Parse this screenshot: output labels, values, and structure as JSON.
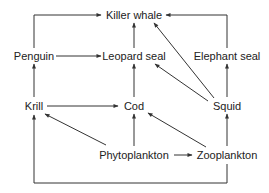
{
  "diagram": {
    "type": "food-web",
    "colors": {
      "background": "#ffffff",
      "line": "#333333",
      "text": "#222222"
    },
    "nodes": {
      "killer_whale": "Killer whale",
      "penguin": "Penguin",
      "leopard_seal": "Leopard seal",
      "elephant_seal": "Elephant seal",
      "krill": "Krill",
      "cod": "Cod",
      "squid": "Squid",
      "phytoplankton": "Phytoplankton",
      "zooplankton": "Zooplankton"
    },
    "edges": [
      {
        "from": "Penguin",
        "to": "Killer whale"
      },
      {
        "from": "Leopard seal",
        "to": "Killer whale"
      },
      {
        "from": "Elephant seal",
        "to": "Killer whale"
      },
      {
        "from": "Squid",
        "to": "Killer whale"
      },
      {
        "from": "Penguin",
        "to": "Leopard seal"
      },
      {
        "from": "Cod",
        "to": "Leopard seal"
      },
      {
        "from": "Squid",
        "to": "Leopard seal"
      },
      {
        "from": "Squid",
        "to": "Elephant seal"
      },
      {
        "from": "Krill",
        "to": "Penguin"
      },
      {
        "from": "Krill",
        "to": "Cod"
      },
      {
        "from": "Phytoplankton",
        "to": "Krill"
      },
      {
        "from": "Phytoplankton",
        "to": "Cod"
      },
      {
        "from": "Phytoplankton",
        "to": "Zooplankton"
      },
      {
        "from": "Zooplankton",
        "to": "Cod"
      },
      {
        "from": "Zooplankton",
        "to": "Squid"
      },
      {
        "from": "Zooplankton",
        "to": "Krill"
      }
    ]
  }
}
